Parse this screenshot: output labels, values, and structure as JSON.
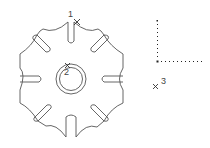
{
  "canvas": {
    "background": "#ffffff",
    "stroke": "#555555"
  },
  "drawing": {
    "part": "gear-shaped plate with 8 slots and concentric center hole",
    "slots": 8,
    "markers": [
      {
        "id": "1",
        "label": "1"
      },
      {
        "id": "2",
        "label": "2"
      },
      {
        "id": "3",
        "label": "3"
      }
    ],
    "ucs_icon": "dotted-axes"
  }
}
